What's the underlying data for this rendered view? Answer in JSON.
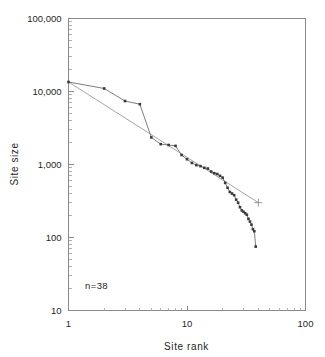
{
  "chart_data": {
    "type": "line",
    "title": "",
    "xlabel": "Site rank",
    "ylabel": "Site size",
    "xscale": "log",
    "yscale": "log",
    "xlim": [
      1,
      100
    ],
    "ylim": [
      10,
      100000
    ],
    "grid": false,
    "legend": null,
    "annotation": "n=38",
    "x_tick_labels": [
      "1",
      "10",
      "100"
    ],
    "x_tick_values": [
      1,
      10,
      100
    ],
    "y_tick_labels": [
      "10",
      "100",
      "1,000",
      "10,000",
      "100,000"
    ],
    "y_tick_values": [
      10,
      100,
      1000,
      10000,
      100000
    ],
    "series": [
      {
        "name": "Observed rank-size",
        "marker": "square",
        "x": [
          1,
          2,
          3,
          4,
          5,
          6,
          7,
          8,
          9,
          10,
          11,
          12,
          13,
          14,
          15,
          16,
          17,
          18,
          19,
          20,
          21,
          22,
          23,
          24,
          25,
          26,
          27,
          28,
          29,
          30,
          31,
          32,
          33,
          34,
          35,
          36,
          37,
          38
        ],
        "values": [
          13500,
          11000,
          7400,
          6700,
          2350,
          1900,
          1850,
          1800,
          1350,
          1180,
          1050,
          980,
          950,
          900,
          880,
          800,
          760,
          740,
          700,
          660,
          560,
          480,
          420,
          400,
          380,
          330,
          300,
          260,
          235,
          225,
          215,
          205,
          180,
          165,
          150,
          130,
          122,
          75
        ]
      },
      {
        "name": "Log-linear fit",
        "marker": "plus-end",
        "x": [
          1,
          40
        ],
        "values": [
          13500,
          300
        ]
      }
    ]
  },
  "axes": {
    "x_title": "Site rank",
    "y_title": "Site size"
  },
  "annotations": {
    "sample_size": "n=38"
  },
  "colors": {
    "frame": "#8a8a8a",
    "data_line": "#6e6e6e",
    "fit_line": "#9a9a9a",
    "marker": "#3a3a3a",
    "text": "#1f1f1f",
    "background": "#ffffff"
  }
}
